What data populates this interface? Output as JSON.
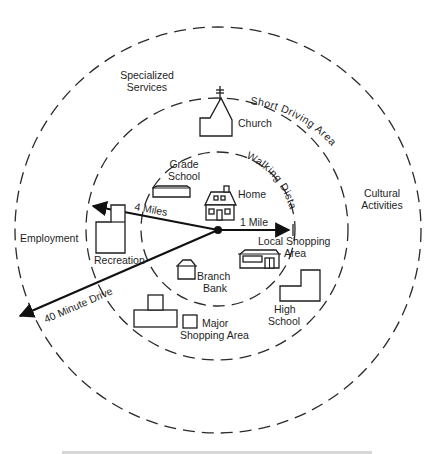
{
  "diagram": {
    "type": "concentric-zones",
    "center": {
      "x": 218,
      "y": 229
    },
    "zones": [
      {
        "name": "Walking Distance",
        "radius": 77,
        "arc_label": "Walking Distance"
      },
      {
        "name": "Short Driving Area",
        "radius": 131,
        "arc_label": "Short Driving Area"
      },
      {
        "name": "outer",
        "radius": 204,
        "arc_label": ""
      }
    ],
    "rays": [
      {
        "label": "1 Mile",
        "to": {
          "x": 293,
          "y": 229
        }
      },
      {
        "label": "4 Miles",
        "to": {
          "x": 89,
          "y": 206
        }
      },
      {
        "label": "40 Minute Drive",
        "to": {
          "x": 16,
          "y": 318
        }
      }
    ],
    "places": {
      "home": "Home",
      "grade_school_line1": "Grade",
      "grade_school_line2": "School",
      "church": "Church",
      "branch_bank_line1": "Branch",
      "branch_bank_line2": "Bank",
      "local_shopping_line1": "Local Shopping",
      "local_shopping_line2": "Area",
      "recreation": "Recreation",
      "high_school_line1": "High",
      "high_school_line2": "School",
      "major_shopping_line1": "Major",
      "major_shopping_line2": "Shopping Area",
      "employment": "Employment",
      "specialized_line1": "Specialized",
      "specialized_line2": "Services",
      "cultural_line1": "Cultural",
      "cultural_line2": "Activities"
    },
    "arc_labels": {
      "short_driving": "Short Driving Area",
      "walking": "Walking Distance"
    },
    "ray_labels": {
      "one_mile": "1 Mile",
      "four_miles": "4 Miles",
      "forty_minute": "40 Minute Drive"
    }
  }
}
